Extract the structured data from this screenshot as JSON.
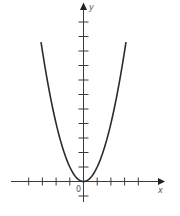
{
  "chart_data": {
    "type": "line",
    "title": "",
    "xlabel": "x",
    "ylabel": "y",
    "origin_label": "0",
    "function": "y = x^2",
    "xlim": [
      -5.3,
      5.9
    ],
    "ylim": [
      -1,
      12
    ],
    "x_ticks": [
      -4,
      -3,
      -2,
      -1,
      1,
      2,
      3,
      4
    ],
    "y_ticks": [
      -1,
      1,
      2,
      3,
      4,
      5,
      6,
      7,
      8,
      9,
      10,
      11
    ],
    "tick_labels_shown": false,
    "grid": false,
    "legend": null,
    "series": [
      {
        "name": "parabola",
        "x": [
          -3.1,
          -3,
          -2.5,
          -2,
          -1.5,
          -1,
          -0.5,
          0,
          0.5,
          1,
          1.5,
          2,
          2.5,
          3,
          3.1
        ],
        "y": [
          9.61,
          9,
          6.25,
          4,
          2.25,
          1,
          0.25,
          0,
          0.25,
          1,
          2.25,
          4,
          6.25,
          9,
          9.61
        ]
      }
    ]
  },
  "style": {
    "axis_color": "#3a3a3a",
    "curve_color": "#2b2b2b",
    "label_color": "#555555"
  }
}
